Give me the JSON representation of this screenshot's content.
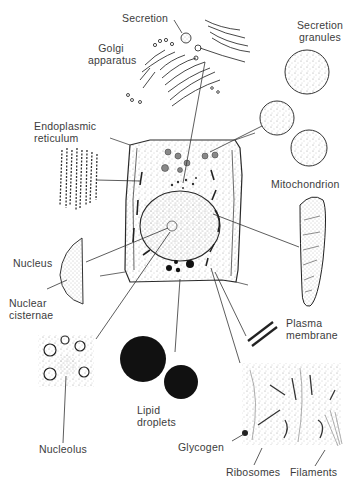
{
  "diagram": {
    "labels": {
      "secretion": "Secretion",
      "golgi_1": "Golgi",
      "golgi_2": "apparatus",
      "secretion_granules_1": "Secretion",
      "secretion_granules_2": "granules",
      "er_1": "Endoplasmic",
      "er_2": "reticulum",
      "mitochondrion": "Mitochondrion",
      "nucleus": "Nucleus",
      "nuclear_cisternae_1": "Nuclear",
      "nuclear_cisternae_2": "cisternae",
      "plasma_membrane_1": "Plasma",
      "plasma_membrane_2": "membrane",
      "lipid_1": "Lipid",
      "lipid_2": "droplets",
      "nucleolus": "Nucleolus",
      "glycogen": "Glycogen",
      "ribosomes": "Ribosomes",
      "filaments": "Filaments"
    },
    "colors": {
      "ink": "#2a2a2a",
      "stipple": "#9a9a9a",
      "label": "#3c3c3c",
      "background": "#ffffff"
    }
  }
}
